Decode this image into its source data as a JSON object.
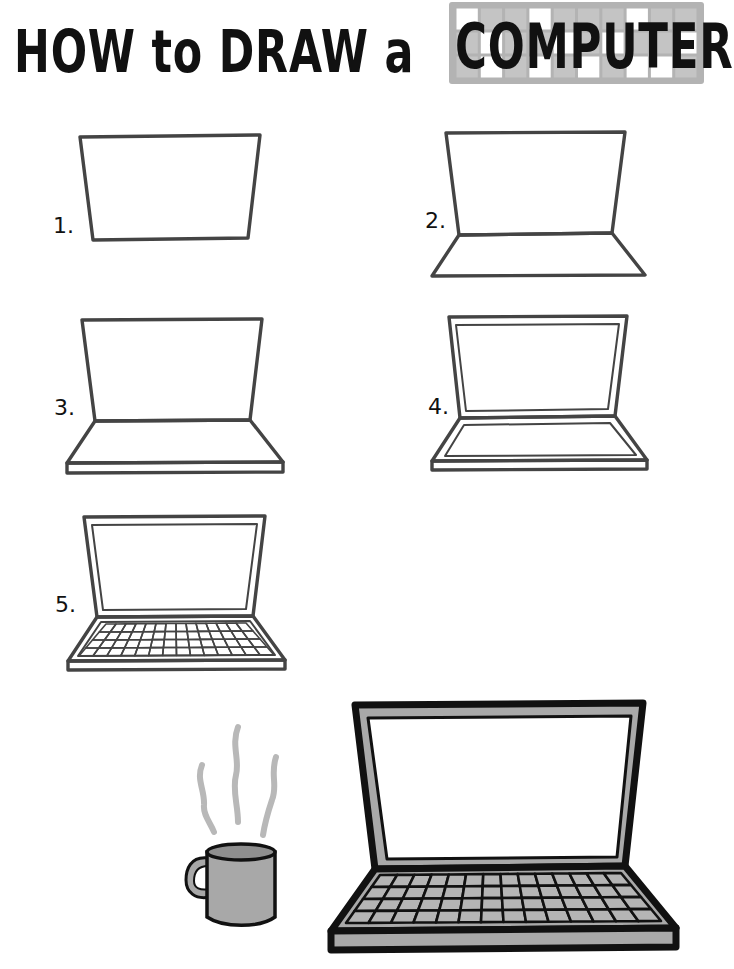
{
  "title": {
    "prefix_words": [
      "HOW",
      "to",
      "DRAW",
      "a"
    ],
    "prefix": "HOW to DRAW a",
    "highlight": "COMPUTER",
    "highlight_background": "keyboard-key-grid",
    "key_grid": {
      "cols": 10,
      "rows": 3,
      "white_keys": [
        [
          0,
          0
        ],
        [
          3,
          0
        ],
        [
          7,
          0
        ],
        [
          1,
          1
        ],
        [
          4,
          1
        ],
        [
          6,
          1
        ],
        [
          9,
          1
        ],
        [
          1,
          2
        ],
        [
          3,
          2
        ],
        [
          5,
          2
        ],
        [
          7,
          2
        ],
        [
          8,
          2
        ]
      ]
    }
  },
  "steps": [
    {
      "number": 1,
      "label": "1.",
      "description": "Screen outline (trapezoid)"
    },
    {
      "number": 2,
      "label": "2.",
      "description": "Add keyboard base"
    },
    {
      "number": 3,
      "label": "3.",
      "description": "Add base thickness"
    },
    {
      "number": 4,
      "label": "4.",
      "description": "Add inner screen bezel and base border"
    },
    {
      "number": 5,
      "label": "5.",
      "description": "Draw keyboard keys"
    }
  ],
  "final_illustration": {
    "laptop": {
      "outline": "#111111",
      "body_fill": "#a9a9a9",
      "screen_fill": "#ffffff",
      "key_fill": "#b5b5b5",
      "key_rows": 4,
      "key_cols": 14
    },
    "mug": {
      "fill": "#a8a8a8",
      "outline": "#111111",
      "steam_lines": 3,
      "steam_color": "#b8b8b8"
    }
  },
  "colors": {
    "line": "#444444",
    "ink": "#111111",
    "gray": "#b3b3b3",
    "background": "#ffffff"
  }
}
